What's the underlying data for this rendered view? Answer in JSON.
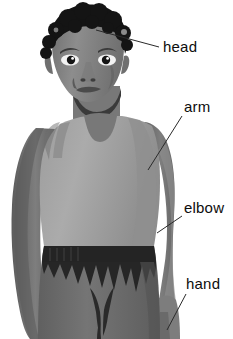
{
  "diagram": {
    "background_color": "#ffffff",
    "label_text_color": "#0d0d0d",
    "leader_line_color": "#2a2a2a",
    "labels": [
      {
        "id": "head",
        "text": "head",
        "text_x": 163,
        "text_y": 52,
        "line": {
          "x1": 96,
          "y1": 30,
          "x2": 159,
          "y2": 47
        }
      },
      {
        "id": "arm",
        "text": "arm",
        "text_x": 184,
        "text_y": 112,
        "line": {
          "x1": 148,
          "y1": 170,
          "x2": 182,
          "y2": 116
        }
      },
      {
        "id": "elbow",
        "text": "elbow",
        "text_x": 184,
        "text_y": 213,
        "line": {
          "x1": 157,
          "y1": 233,
          "x2": 182,
          "y2": 216
        }
      },
      {
        "id": "hand",
        "text": "hand",
        "text_x": 186,
        "text_y": 289,
        "line": {
          "x1": 167,
          "y1": 330,
          "x2": 186,
          "y2": 294
        }
      }
    ]
  },
  "palette": {
    "skin_light": "#8f8f8f",
    "skin_mid": "#7a7a7a",
    "skin_dark": "#636363",
    "skin_shadow": "#4f4f4f",
    "hair_dark": "#141414",
    "shirt_light": "#a8a8a8",
    "shirt_mid": "#9a9a9a",
    "shirt_shadow": "#8a8a8a",
    "pants_mid": "#6e6e6e",
    "pants_dark": "#2b2b2b",
    "eye_white": "#f2f2f2",
    "eye_dark": "#1a1a1a"
  }
}
